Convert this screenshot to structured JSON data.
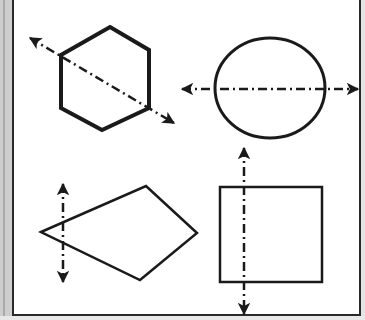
{
  "diagram": {
    "colors": {
      "stroke": "#1a1a1a",
      "background": "#ffffff",
      "frame": "#2a2a2a",
      "side_bar": "#cfcfcf"
    },
    "shapes": [
      {
        "name": "hexagon",
        "position": "top-left",
        "points": "110,27 149,50 149,108 102,130 61,108 61,55",
        "stroke_width": 4,
        "line": {
          "x1": 30,
          "y1": 38,
          "x2": 174,
          "y2": 123,
          "orientation": "diagonal"
        }
      },
      {
        "name": "circle",
        "position": "top-right",
        "cx": 270,
        "cy": 88,
        "rx": 55,
        "ry": 50,
        "stroke_width": 3,
        "line": {
          "x1": 182,
          "y1": 89,
          "x2": 358,
          "y2": 89,
          "orientation": "horizontal"
        }
      },
      {
        "name": "kite",
        "position": "bottom-left",
        "points": "41,232 146,186 197,233 140,280",
        "stroke_width": 2.5,
        "line": {
          "x1": 63,
          "y1": 184,
          "x2": 63,
          "y2": 282,
          "orientation": "vertical"
        }
      },
      {
        "name": "square",
        "position": "bottom-right",
        "x": 220,
        "y": 187,
        "width": 102,
        "height": 95,
        "stroke_width": 2.5,
        "line": {
          "x1": 244,
          "y1": 148,
          "x2": 244,
          "y2": 314,
          "orientation": "vertical"
        }
      }
    ]
  }
}
